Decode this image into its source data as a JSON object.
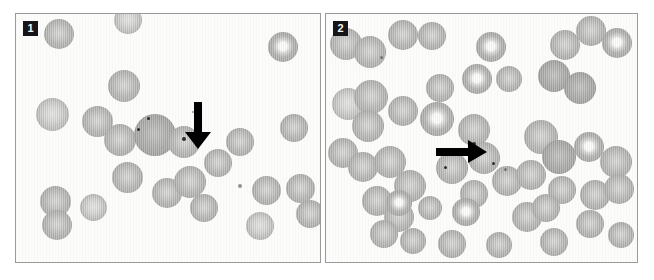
{
  "figure": {
    "type": "microscopy-figure",
    "background_color": "#ffffff",
    "panel_border_color": "#9a9a9a",
    "badge_background": "#16161a",
    "badge_text_color": "#f4f4f4",
    "cell_color": "#b4b4b2",
    "arrow_color": "#000000"
  },
  "panels": [
    {
      "id": "panel-1",
      "label": "1",
      "arrow": {
        "name": "down-arrow",
        "direction": "down",
        "x": 168,
        "y": 88,
        "width": 28,
        "height": 48
      },
      "cells": [
        {
          "x": 28,
          "y": 5,
          "d": 30,
          "style": ""
        },
        {
          "x": 98,
          "y": -8,
          "d": 28,
          "style": "pale"
        },
        {
          "x": 252,
          "y": 18,
          "d": 30,
          "style": "pallor"
        },
        {
          "x": 92,
          "y": 56,
          "d": 32,
          "style": ""
        },
        {
          "x": 20,
          "y": 84,
          "d": 33,
          "style": "pale"
        },
        {
          "x": 66,
          "y": 92,
          "d": 31,
          "style": ""
        },
        {
          "x": 88,
          "y": 110,
          "d": 32,
          "style": ""
        },
        {
          "x": 118,
          "y": 100,
          "d": 42,
          "style": "dark"
        },
        {
          "x": 152,
          "y": 112,
          "d": 32,
          "style": ""
        },
        {
          "x": 210,
          "y": 114,
          "d": 28,
          "style": ""
        },
        {
          "x": 264,
          "y": 100,
          "d": 28,
          "style": ""
        },
        {
          "x": 188,
          "y": 135,
          "d": 28,
          "style": ""
        },
        {
          "x": 96,
          "y": 148,
          "d": 31,
          "style": ""
        },
        {
          "x": 136,
          "y": 164,
          "d": 30,
          "style": ""
        },
        {
          "x": 158,
          "y": 152,
          "d": 32,
          "style": ""
        },
        {
          "x": 174,
          "y": 180,
          "d": 28,
          "style": ""
        },
        {
          "x": 24,
          "y": 172,
          "d": 31,
          "style": ""
        },
        {
          "x": 64,
          "y": 180,
          "d": 27,
          "style": "pale"
        },
        {
          "x": 26,
          "y": 196,
          "d": 30,
          "style": ""
        },
        {
          "x": 236,
          "y": 162,
          "d": 29,
          "style": ""
        },
        {
          "x": 270,
          "y": 160,
          "d": 29,
          "style": ""
        },
        {
          "x": 280,
          "y": 186,
          "d": 28,
          "style": ""
        },
        {
          "x": 230,
          "y": 198,
          "d": 28,
          "style": "pale"
        }
      ],
      "inclusions": [
        {
          "x": 166,
          "y": 123,
          "d": 4
        },
        {
          "x": 131,
          "y": 103,
          "d": 3
        },
        {
          "x": 121,
          "y": 114,
          "d": 3
        }
      ],
      "specks": [
        {
          "x": 222,
          "y": 170,
          "d": 4
        },
        {
          "x": 176,
          "y": 97,
          "d": 2
        }
      ]
    },
    {
      "id": "panel-2",
      "label": "2",
      "arrow": {
        "name": "right-arrow",
        "direction": "right",
        "x": 110,
        "y": 126,
        "width": 52,
        "height": 24
      },
      "cells": [
        {
          "x": 4,
          "y": 14,
          "d": 32,
          "style": ""
        },
        {
          "x": 28,
          "y": 22,
          "d": 32,
          "style": ""
        },
        {
          "x": 62,
          "y": 6,
          "d": 30,
          "style": ""
        },
        {
          "x": 92,
          "y": 8,
          "d": 28,
          "style": ""
        },
        {
          "x": 150,
          "y": 18,
          "d": 30,
          "style": "pallor"
        },
        {
          "x": 224,
          "y": 16,
          "d": 30,
          "style": ""
        },
        {
          "x": 250,
          "y": 2,
          "d": 30,
          "style": ""
        },
        {
          "x": 276,
          "y": 14,
          "d": 30,
          "style": "pallor"
        },
        {
          "x": 212,
          "y": 46,
          "d": 32,
          "style": "dark"
        },
        {
          "x": 238,
          "y": 58,
          "d": 32,
          "style": "dark"
        },
        {
          "x": 170,
          "y": 52,
          "d": 26,
          "style": ""
        },
        {
          "x": 136,
          "y": 50,
          "d": 30,
          "style": "pallor"
        },
        {
          "x": 100,
          "y": 60,
          "d": 28,
          "style": ""
        },
        {
          "x": 6,
          "y": 74,
          "d": 32,
          "style": "pale"
        },
        {
          "x": 28,
          "y": 66,
          "d": 34,
          "style": ""
        },
        {
          "x": 26,
          "y": 96,
          "d": 32,
          "style": ""
        },
        {
          "x": 62,
          "y": 82,
          "d": 30,
          "style": ""
        },
        {
          "x": 94,
          "y": 88,
          "d": 34,
          "style": "pallor"
        },
        {
          "x": 132,
          "y": 100,
          "d": 32,
          "style": ""
        },
        {
          "x": 198,
          "y": 106,
          "d": 34,
          "style": ""
        },
        {
          "x": 216,
          "y": 126,
          "d": 34,
          "style": "dark"
        },
        {
          "x": 248,
          "y": 118,
          "d": 30,
          "style": "pallor"
        },
        {
          "x": 274,
          "y": 132,
          "d": 32,
          "style": ""
        },
        {
          "x": 2,
          "y": 124,
          "d": 30,
          "style": ""
        },
        {
          "x": 22,
          "y": 138,
          "d": 30,
          "style": ""
        },
        {
          "x": 48,
          "y": 132,
          "d": 32,
          "style": ""
        },
        {
          "x": 68,
          "y": 156,
          "d": 32,
          "style": ""
        },
        {
          "x": 110,
          "y": 138,
          "d": 32,
          "style": ""
        },
        {
          "x": 142,
          "y": 128,
          "d": 32,
          "style": ""
        },
        {
          "x": 166,
          "y": 152,
          "d": 30,
          "style": ""
        },
        {
          "x": 190,
          "y": 146,
          "d": 30,
          "style": ""
        },
        {
          "x": 134,
          "y": 166,
          "d": 28,
          "style": ""
        },
        {
          "x": 222,
          "y": 162,
          "d": 28,
          "style": ""
        },
        {
          "x": 254,
          "y": 166,
          "d": 30,
          "style": ""
        },
        {
          "x": 278,
          "y": 160,
          "d": 30,
          "style": ""
        },
        {
          "x": 36,
          "y": 172,
          "d": 30,
          "style": ""
        },
        {
          "x": 58,
          "y": 188,
          "d": 30,
          "style": ""
        },
        {
          "x": 92,
          "y": 182,
          "d": 24,
          "style": ""
        },
        {
          "x": 60,
          "y": 176,
          "d": 26,
          "style": "pallor"
        },
        {
          "x": 126,
          "y": 184,
          "d": 28,
          "style": "pallor"
        },
        {
          "x": 186,
          "y": 188,
          "d": 30,
          "style": ""
        },
        {
          "x": 206,
          "y": 180,
          "d": 28,
          "style": ""
        },
        {
          "x": 250,
          "y": 196,
          "d": 28,
          "style": ""
        },
        {
          "x": 44,
          "y": 206,
          "d": 28,
          "style": ""
        },
        {
          "x": 74,
          "y": 214,
          "d": 26,
          "style": ""
        },
        {
          "x": 112,
          "y": 216,
          "d": 28,
          "style": ""
        },
        {
          "x": 160,
          "y": 218,
          "d": 26,
          "style": ""
        },
        {
          "x": 214,
          "y": 214,
          "d": 28,
          "style": ""
        },
        {
          "x": 282,
          "y": 208,
          "d": 26,
          "style": ""
        }
      ],
      "inclusions": [
        {
          "x": 146,
          "y": 128,
          "d": 4
        },
        {
          "x": 166,
          "y": 148,
          "d": 3
        },
        {
          "x": 118,
          "y": 152,
          "d": 3
        }
      ],
      "specks": [
        {
          "x": 54,
          "y": 42,
          "d": 3
        },
        {
          "x": 178,
          "y": 154,
          "d": 3
        }
      ]
    }
  ]
}
